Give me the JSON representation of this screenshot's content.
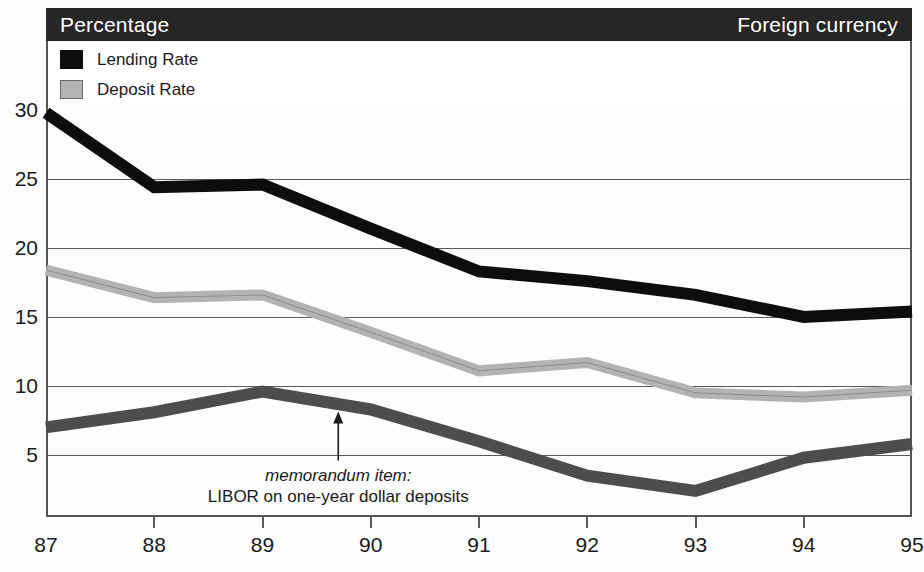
{
  "header": {
    "title": "Percentage",
    "right_label": "Foreign currency"
  },
  "legend": {
    "items": [
      {
        "label": "Lending Rate",
        "color": "#0d0d0d",
        "swatch": "lending-swatch"
      },
      {
        "label": "Deposit Rate",
        "color": "#b3b3b3",
        "swatch": "deposit-swatch"
      }
    ]
  },
  "annotation": {
    "line1": "memorandum item:",
    "line2": "LIBOR on one-year dollar deposits",
    "arrow_x_year": 89.7,
    "arrow_target_value": 8.3
  },
  "chart_data": {
    "type": "line",
    "title": "Percentage",
    "subtitle": "Foreign currency",
    "xlabel": "",
    "ylabel": "Percentage",
    "x": [
      "87",
      "88",
      "89",
      "90",
      "91",
      "92",
      "93",
      "94",
      "95"
    ],
    "xlim": [
      87,
      95
    ],
    "ylim": [
      0,
      31.5
    ],
    "yticks": [
      5,
      10,
      15,
      20,
      25,
      30
    ],
    "grid": true,
    "legend_position": "top-left",
    "series": [
      {
        "name": "Lending Rate",
        "color": "#0d0d0d",
        "values": [
          29.8,
          24.4,
          24.6,
          21.4,
          18.3,
          17.6,
          16.6,
          15.0,
          15.4
        ]
      },
      {
        "name": "Deposit Rate",
        "color": "#b3b3b3",
        "values": [
          18.4,
          16.4,
          16.6,
          13.9,
          11.1,
          11.7,
          9.5,
          9.2,
          9.7
        ]
      },
      {
        "name": "LIBOR on one-year dollar deposits",
        "color": "#4d4d4d",
        "values": [
          7.0,
          8.1,
          9.6,
          8.3,
          6.0,
          3.5,
          2.4,
          4.8,
          5.8
        ]
      }
    ]
  }
}
